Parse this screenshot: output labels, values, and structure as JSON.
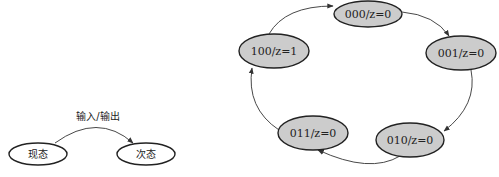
{
  "left_diagram": {
    "transition_label": "输入/输出",
    "nodes": [
      {
        "id": "present",
        "label": "现态"
      },
      {
        "id": "next",
        "label": "次态"
      }
    ]
  },
  "right_diagram": {
    "node_fill": "#cccccc",
    "nodes": [
      {
        "id": "s000",
        "label": "000/z=0"
      },
      {
        "id": "s001",
        "label": "001/z=0"
      },
      {
        "id": "s010",
        "label": "010/z=0"
      },
      {
        "id": "s011",
        "label": "011/z=0"
      },
      {
        "id": "s100",
        "label": "100/z=1"
      }
    ],
    "transitions": [
      {
        "from": "000/z=0",
        "to": "001/z=0"
      },
      {
        "from": "001/z=0",
        "to": "010/z=0"
      },
      {
        "from": "010/z=0",
        "to": "011/z=0"
      },
      {
        "from": "011/z=0",
        "to": "100/z=1"
      },
      {
        "from": "100/z=1",
        "to": "000/z=0"
      }
    ]
  }
}
